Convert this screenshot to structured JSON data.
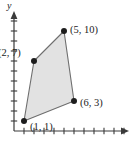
{
  "figure": {
    "background_color": "#ffffff",
    "axis_color": "#3a3a3a",
    "label_color": "#1d1d1d"
  },
  "axes": {
    "y_axis_name": "y",
    "x_axis_name": "",
    "origin_px": {
      "x": 14,
      "y": 131
    },
    "unit_px": 10,
    "x_tick_count": 11,
    "y_tick_count": 11,
    "x_axis_length_px": 114,
    "y_axis_length_px": 118,
    "grid": false
  },
  "chart_data": {
    "type": "scatter",
    "title": "",
    "subtitle": "",
    "xlabel": "",
    "ylabel": "y",
    "xlim": [
      0,
      11
    ],
    "ylim": [
      0,
      11
    ],
    "grid": false,
    "legend": "none",
    "shape": {
      "name": "quadrilateral",
      "fill_color": "#e2e2e2",
      "stroke_color": "#6e6e6e",
      "stroke_width": 1.1,
      "closed": true,
      "vertex_order": [
        "(1, 1)",
        "(2, 7)",
        "(5, 10)",
        "(6, 3)"
      ]
    },
    "points": [
      {
        "label": "(1, 1)",
        "x": 1,
        "y": 1,
        "dot_color": "#1d1d1d",
        "label_dx": 6,
        "label_dy": 9
      },
      {
        "label": "(2, 7)",
        "x": 2,
        "y": 7,
        "dot_color": "#1d1d1d",
        "label_dx": -36,
        "label_dy": -5
      },
      {
        "label": "(5, 10)",
        "x": 5,
        "y": 10,
        "dot_color": "#1d1d1d",
        "label_dx": 6,
        "label_dy": 2
      },
      {
        "label": "(6, 3)",
        "x": 6,
        "y": 3,
        "dot_color": "#1d1d1d",
        "label_dx": 6,
        "label_dy": 5
      }
    ],
    "x": [
      1,
      2,
      5,
      6
    ],
    "values": [
      1,
      7,
      10,
      3
    ],
    "categories": [
      "(1, 1)",
      "(2, 7)",
      "(5, 10)",
      "(6, 3)"
    ],
    "annotations": [
      {
        "text": "(1, 1)",
        "for_point": 0
      },
      {
        "text": "(2, 7)",
        "for_point": 1
      },
      {
        "text": "(5, 10)",
        "for_point": 2
      },
      {
        "text": "(6, 3)",
        "for_point": 3
      }
    ]
  }
}
